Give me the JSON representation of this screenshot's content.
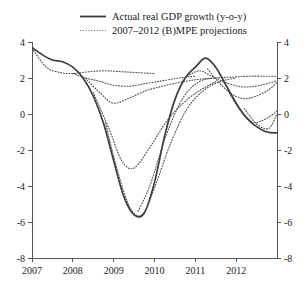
{
  "chart_data": {
    "type": "line",
    "title": "",
    "xlabel": "",
    "ylabel": "",
    "xlim": [
      2007.0,
      2013.0
    ],
    "ylim": [
      -8,
      4
    ],
    "grid": false,
    "legend_position": "top-center",
    "y_ticks": [
      "4",
      "2",
      "0",
      "-2",
      "-4",
      "-6",
      "-8"
    ],
    "y_tick_values": [
      4,
      2,
      0,
      -2,
      -4,
      -6,
      -8
    ],
    "y_ticks_right": [
      "4",
      "2",
      "0",
      "-2",
      "-4",
      "-6",
      "-8"
    ],
    "x_ticks": [
      "2007",
      "2008",
      "2009",
      "2010",
      "2011",
      "2012"
    ],
    "x_tick_values": [
      2007,
      2008,
      2009,
      2010,
      2011,
      2012
    ],
    "legend": [
      {
        "label": "Actual real GDP growth (y-o-y)",
        "style": "solid"
      },
      {
        "label": "2007–2012 (B)MPE projections",
        "style": "dotted"
      }
    ],
    "series": [
      {
        "name": "Actual real GDP growth (y-o-y)",
        "style": "solid",
        "x": [
          2007.0,
          2007.25,
          2007.5,
          2007.75,
          2008.0,
          2008.25,
          2008.5,
          2008.75,
          2009.0,
          2009.25,
          2009.5,
          2009.75,
          2010.0,
          2010.25,
          2010.5,
          2010.75,
          2011.0,
          2011.25,
          2011.5,
          2011.75,
          2012.0,
          2012.25,
          2012.5,
          2012.75,
          2013.0
        ],
        "y": [
          3.7,
          3.3,
          3.0,
          2.9,
          2.6,
          2.0,
          1.0,
          -0.5,
          -2.6,
          -4.6,
          -5.6,
          -5.5,
          -3.8,
          -1.2,
          0.8,
          2.0,
          2.6,
          3.1,
          2.6,
          1.6,
          0.6,
          -0.2,
          -0.7,
          -1.0,
          -1.05
        ]
      },
      {
        "name": "2007 (B)MPE projection",
        "style": "dotted",
        "x": [
          2007.0,
          2007.35,
          2007.7,
          2008.0,
          2008.4,
          2008.8,
          2009.2,
          2009.6,
          2010.0
        ],
        "y": [
          3.65,
          2.6,
          2.3,
          2.25,
          2.35,
          2.4,
          2.35,
          2.3,
          2.25
        ]
      },
      {
        "name": "2008 (B)MPE projection",
        "style": "dotted",
        "x": [
          2008.0,
          2008.3,
          2008.6,
          2009.0,
          2009.4,
          2009.8,
          2010.2,
          2010.6,
          2011.0
        ],
        "y": [
          2.25,
          2.0,
          1.85,
          1.6,
          1.55,
          1.7,
          1.85,
          2.0,
          2.1
        ]
      },
      {
        "name": "2008H2 (B)MPE projection",
        "style": "dotted",
        "x": [
          2008.3,
          2008.7,
          2009.0,
          2009.4,
          2009.8,
          2010.2,
          2010.6,
          2011.0,
          2011.4
        ],
        "y": [
          2.0,
          1.1,
          0.6,
          0.9,
          1.3,
          1.55,
          1.75,
          1.9,
          2.0
        ]
      },
      {
        "name": "2009H1 (B)MPE projection",
        "style": "dotted",
        "x": [
          2008.5,
          2008.9,
          2009.2,
          2009.5,
          2009.9,
          2010.3,
          2010.7,
          2011.1,
          2011.5
        ],
        "y": [
          1.2,
          -0.9,
          -2.6,
          -3.0,
          -1.8,
          -0.4,
          0.6,
          1.3,
          1.8
        ]
      },
      {
        "name": "2009H2 (B)MPE projection",
        "style": "dotted",
        "x": [
          2008.8,
          2009.1,
          2009.4,
          2009.7,
          2010.0,
          2010.4,
          2010.8,
          2011.2,
          2011.6,
          2012.0
        ],
        "y": [
          -0.5,
          -3.2,
          -5.2,
          -5.6,
          -4.1,
          -1.6,
          0.3,
          1.3,
          1.8,
          2.0
        ]
      },
      {
        "name": "2010 (B)MPE projection",
        "style": "dotted",
        "x": [
          2009.6,
          2009.9,
          2010.3,
          2010.7,
          2011.1,
          2011.5,
          2011.9,
          2012.3,
          2012.7,
          2013.0
        ],
        "y": [
          -5.4,
          -3.9,
          -1.1,
          0.9,
          1.8,
          2.0,
          2.05,
          2.1,
          2.1,
          2.1
        ]
      },
      {
        "name": "2011 (B)MPE projection",
        "style": "dotted",
        "x": [
          2010.8,
          2011.1,
          2011.4,
          2011.8,
          2012.2,
          2012.6,
          2013.0
        ],
        "y": [
          2.1,
          2.4,
          2.1,
          1.7,
          1.5,
          1.6,
          1.85
        ]
      },
      {
        "name": "2011H2 (B)MPE projection",
        "style": "dotted",
        "x": [
          2011.3,
          2011.6,
          2011.9,
          2012.2,
          2012.5,
          2012.8,
          2013.0
        ],
        "y": [
          2.5,
          1.7,
          1.1,
          0.85,
          1.0,
          1.35,
          1.75
        ]
      },
      {
        "name": "2012 (B)MPE projection",
        "style": "dotted",
        "x": [
          2011.8,
          2012.1,
          2012.4,
          2012.7,
          2013.0
        ],
        "y": [
          1.3,
          0.2,
          -0.45,
          -0.3,
          0.15
        ]
      },
      {
        "name": "2012H2 (B)MPE projection",
        "style": "dotted",
        "x": [
          2012.2,
          2012.5,
          2012.8,
          2013.0
        ],
        "y": [
          0.3,
          -0.55,
          -0.8,
          0.0
        ]
      }
    ]
  },
  "plot_geometry": {
    "left": 32,
    "right": 277,
    "top": 42,
    "bottom": 258
  }
}
